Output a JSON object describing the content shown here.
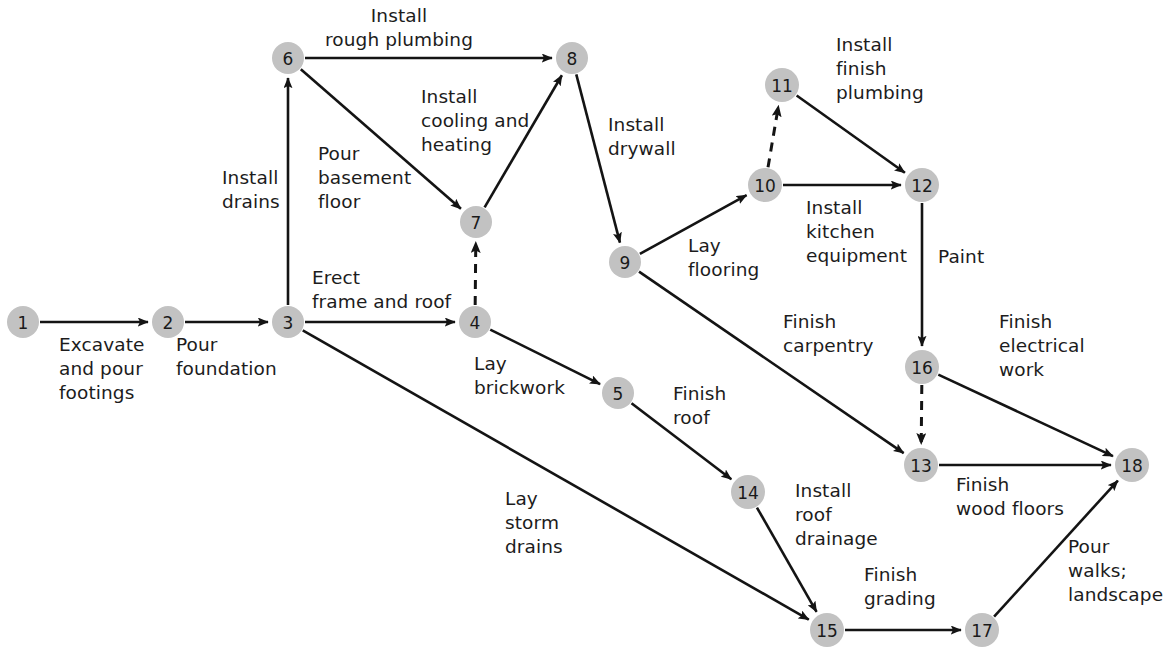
{
  "diagram": {
    "type": "activity-on-arrow network diagram",
    "node_fill_color": "#c2c2c2",
    "edge_color": "#141414",
    "background_color": "#ffffff"
  },
  "nodes": [
    {
      "id": "1",
      "label": "1",
      "x": 23,
      "y": 322,
      "r": 16
    },
    {
      "id": "2",
      "label": "2",
      "x": 168,
      "y": 322,
      "r": 16
    },
    {
      "id": "3",
      "label": "3",
      "x": 288,
      "y": 322,
      "r": 16
    },
    {
      "id": "4",
      "label": "4",
      "x": 475,
      "y": 322,
      "r": 16
    },
    {
      "id": "5",
      "label": "5",
      "x": 618,
      "y": 393,
      "r": 16
    },
    {
      "id": "6",
      "label": "6",
      "x": 288,
      "y": 58,
      "r": 16
    },
    {
      "id": "7",
      "label": "7",
      "x": 476,
      "y": 222,
      "r": 16
    },
    {
      "id": "8",
      "label": "8",
      "x": 572,
      "y": 58,
      "r": 16
    },
    {
      "id": "9",
      "label": "9",
      "x": 625,
      "y": 262,
      "r": 16
    },
    {
      "id": "10",
      "label": "10",
      "x": 765,
      "y": 185,
      "r": 17
    },
    {
      "id": "11",
      "label": "11",
      "x": 782,
      "y": 85,
      "r": 17
    },
    {
      "id": "12",
      "label": "12",
      "x": 922,
      "y": 185,
      "r": 17
    },
    {
      "id": "13",
      "label": "13",
      "x": 921,
      "y": 465,
      "r": 17
    },
    {
      "id": "14",
      "label": "14",
      "x": 748,
      "y": 492,
      "r": 17
    },
    {
      "id": "15",
      "label": "15",
      "x": 827,
      "y": 630,
      "r": 17
    },
    {
      "id": "16",
      "label": "16",
      "x": 922,
      "y": 367,
      "r": 17
    },
    {
      "id": "17",
      "label": "17",
      "x": 982,
      "y": 630,
      "r": 17
    },
    {
      "id": "18",
      "label": "18",
      "x": 1132,
      "y": 465,
      "r": 17
    }
  ],
  "edges": [
    {
      "id": "e1",
      "from": "1",
      "to": "2",
      "style": "solid",
      "label": "Excavate\nand pour\nfootings",
      "label_x": 59,
      "label_y": 333,
      "align": "l"
    },
    {
      "id": "e2",
      "from": "2",
      "to": "3",
      "style": "solid",
      "label": "Pour\nfoundation",
      "label_x": 176,
      "label_y": 333,
      "align": "l"
    },
    {
      "id": "e3",
      "from": "3",
      "to": "6",
      "style": "solid",
      "label": "Install\ndrains",
      "label_x": 222,
      "label_y": 166,
      "align": "l"
    },
    {
      "id": "e4",
      "from": "3",
      "to": "4",
      "style": "solid",
      "label": "Erect\nframe and roof",
      "label_x": 312,
      "label_y": 266,
      "align": "l"
    },
    {
      "id": "e5",
      "from": "3",
      "to": "15",
      "style": "solid",
      "label": "Lay\nstorm\ndrains",
      "label_x": 505,
      "label_y": 487,
      "align": "l"
    },
    {
      "id": "e6",
      "from": "6",
      "to": "8",
      "style": "solid",
      "label": "Install\nrough plumbing",
      "label_x": 399,
      "label_y": 4,
      "align": "c"
    },
    {
      "id": "e7",
      "from": "6",
      "to": "7",
      "style": "solid",
      "label": "Pour\nbasement\nfloor",
      "label_x": 318,
      "label_y": 142,
      "align": "l"
    },
    {
      "id": "e8",
      "from": "4",
      "to": "7",
      "style": "dashed",
      "label": "",
      "label_x": 0,
      "label_y": 0,
      "align": "c"
    },
    {
      "id": "e9",
      "from": "7",
      "to": "8",
      "style": "solid",
      "label": "Install\ncooling and\nheating",
      "label_x": 421,
      "label_y": 85,
      "align": "l"
    },
    {
      "id": "e10",
      "from": "8",
      "to": "9",
      "style": "solid",
      "label": "Install\ndrywall",
      "label_x": 608,
      "label_y": 113,
      "align": "l"
    },
    {
      "id": "e11",
      "from": "4",
      "to": "5",
      "style": "solid",
      "label": "Lay\nbrickwork",
      "label_x": 474,
      "label_y": 352,
      "align": "l"
    },
    {
      "id": "e12",
      "from": "5",
      "to": "14",
      "style": "solid",
      "label": "Finish\nroof",
      "label_x": 673,
      "label_y": 382,
      "align": "l"
    },
    {
      "id": "e13",
      "from": "9",
      "to": "10",
      "style": "solid",
      "label": "Lay\nflooring",
      "label_x": 688,
      "label_y": 234,
      "align": "l"
    },
    {
      "id": "e14",
      "from": "9",
      "to": "13",
      "style": "solid",
      "label": "Finish\ncarpentry",
      "label_x": 783,
      "label_y": 310,
      "align": "l"
    },
    {
      "id": "e15",
      "from": "10",
      "to": "11",
      "style": "dashed",
      "label": "",
      "label_x": 0,
      "label_y": 0,
      "align": "c"
    },
    {
      "id": "e16",
      "from": "10",
      "to": "12",
      "style": "solid",
      "label": "Install\nkitchen\nequipment",
      "label_x": 806,
      "label_y": 196,
      "align": "l"
    },
    {
      "id": "e17",
      "from": "11",
      "to": "12",
      "style": "solid",
      "label": "Install\nfinish\nplumbing",
      "label_x": 836,
      "label_y": 33,
      "align": "l"
    },
    {
      "id": "e18",
      "from": "12",
      "to": "16",
      "style": "solid",
      "label": "Paint",
      "label_x": 938,
      "label_y": 245,
      "align": "l"
    },
    {
      "id": "e19",
      "from": "16",
      "to": "13",
      "style": "dashed",
      "label": "",
      "label_x": 0,
      "label_y": 0,
      "align": "c"
    },
    {
      "id": "e20",
      "from": "16",
      "to": "18",
      "style": "solid",
      "label": "Finish\nelectrical\nwork",
      "label_x": 999,
      "label_y": 310,
      "align": "l"
    },
    {
      "id": "e21",
      "from": "13",
      "to": "18",
      "style": "solid",
      "label": "Finish\nwood floors",
      "label_x": 956,
      "label_y": 473,
      "align": "l"
    },
    {
      "id": "e22",
      "from": "14",
      "to": "15",
      "style": "solid",
      "label": "Install\nroof\ndrainage",
      "label_x": 795,
      "label_y": 479,
      "align": "l"
    },
    {
      "id": "e23",
      "from": "15",
      "to": "17",
      "style": "solid",
      "label": "Finish\ngrading",
      "label_x": 864,
      "label_y": 563,
      "align": "l"
    },
    {
      "id": "e24",
      "from": "17",
      "to": "18",
      "style": "solid",
      "label": "Pour\nwalks;\nlandscape",
      "label_x": 1068,
      "label_y": 535,
      "align": "l"
    }
  ]
}
